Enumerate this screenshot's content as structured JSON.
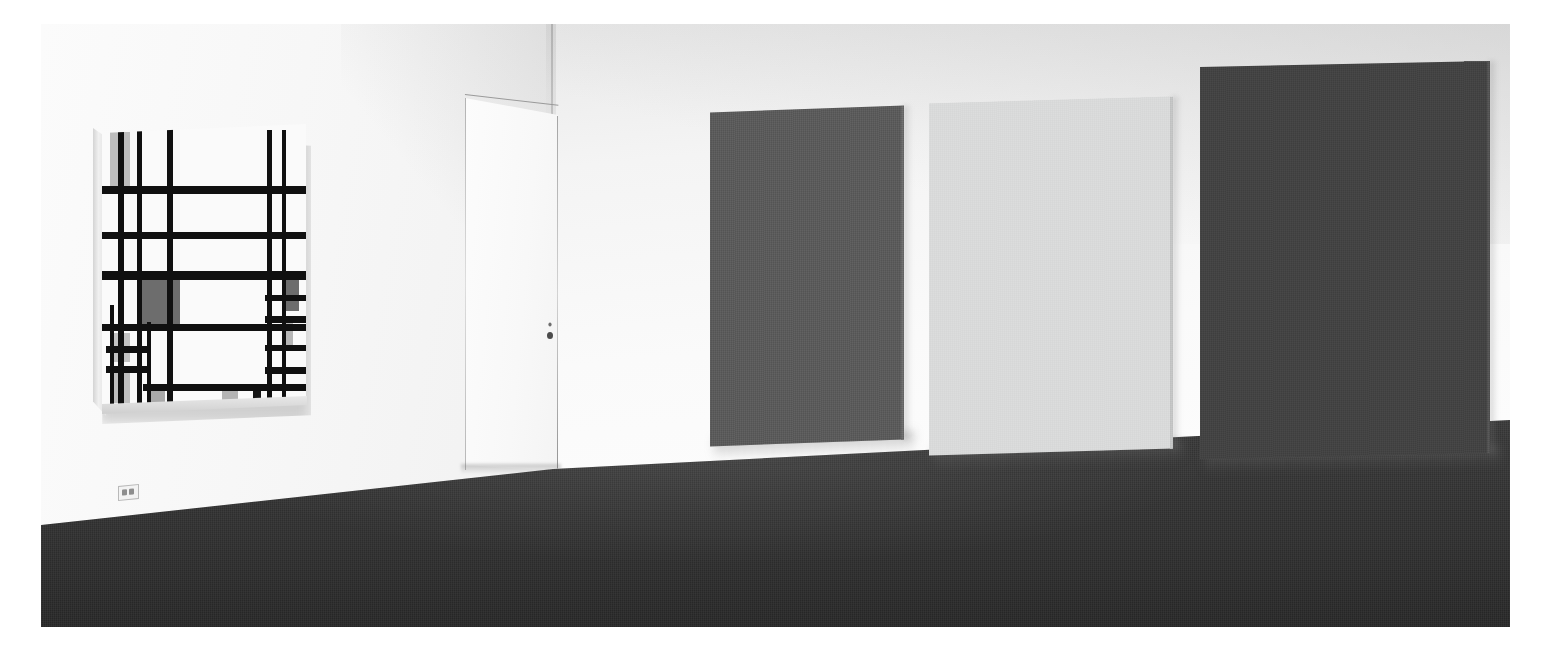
{
  "scene": {
    "title": "Gallery interior installation view",
    "room": {
      "wall_left_color": "#f7f7f7",
      "wall_right_color": "#f7f7f7",
      "floor_color": "#323232",
      "baseboard_color": "#fdfdfd",
      "corner_seam_label": "wall corner"
    },
    "door": {
      "label": "flush gallery door",
      "color": "#f9f9f9",
      "hardware": "keyhole-lock"
    },
    "outlet": {
      "label": "wall electrical outlet",
      "color": "#f3f3f3"
    }
  },
  "artworks": [
    {
      "id": "mondrian-grid",
      "wall": "left",
      "type": "neoplastic-grid-painting",
      "line_color": "#101010",
      "ground_color": "#fafafa",
      "accent_colors": [
        "#9a9a9a",
        "#c8c8c8",
        "#6b6b6b",
        "#bdbdbd"
      ],
      "description": "Black grid composition with gray and charcoal blocks on white ground"
    },
    {
      "id": "monochrome-left",
      "wall": "right",
      "type": "monochrome-panel",
      "color": "#5b5b5b",
      "description": "Medium-dark gray monochrome canvas"
    },
    {
      "id": "monochrome-center",
      "wall": "right",
      "type": "monochrome-panel",
      "color": "#d9dada",
      "description": "Pale light-gray monochrome canvas"
    },
    {
      "id": "monochrome-right",
      "wall": "right",
      "type": "monochrome-panel",
      "color": "#434343",
      "description": "Dark charcoal monochrome canvas"
    }
  ],
  "chart_data": {
    "type": "table",
    "columns": [
      "element",
      "kind",
      "x",
      "y",
      "w",
      "h",
      "color"
    ],
    "rows": [
      [
        "field-topleft-gray",
        "field",
        4.0,
        3.0,
        9.5,
        21.0,
        "#bdbdbd"
      ],
      [
        "field-mid-charcoal",
        "field",
        19.0,
        54.0,
        19.0,
        19.0,
        "#6d6d6d"
      ],
      [
        "field-left-gray-a",
        "field",
        4.0,
        74.0,
        9.5,
        10.0,
        "#c3c3c3"
      ],
      [
        "field-left-gray-b",
        "field",
        4.0,
        86.5,
        9.5,
        12.0,
        "#bfbfbf"
      ],
      [
        "field-right-charcoal",
        "field",
        88.5,
        53.0,
        8.0,
        13.0,
        "#6d6d6d"
      ],
      [
        "field-right-gray",
        "field",
        88.5,
        70.0,
        5.0,
        8.0,
        "#b6b6b6"
      ],
      [
        "field-bottom-gray-a",
        "field",
        24.0,
        93.0,
        7.0,
        6.0,
        "#a9a9a9"
      ],
      [
        "field-bottom-gray-b",
        "field",
        59.0,
        93.0,
        7.5,
        6.0,
        "#b4b4b4"
      ],
      [
        "field-bottom-black",
        "field",
        74.0,
        93.0,
        4.0,
        6.0,
        "#151515"
      ],
      [
        "vline-1",
        "bar-v",
        8.0,
        0.0,
        2.6,
        100.0,
        "#101010"
      ],
      [
        "vline-2",
        "bar-v",
        17.0,
        0.0,
        2.6,
        100.0,
        "#101010"
      ],
      [
        "vline-3",
        "bar-v",
        32.0,
        0.0,
        2.6,
        100.0,
        "#101010"
      ],
      [
        "vline-4",
        "bar-v",
        81.0,
        2.0,
        2.2,
        98.0,
        "#101010"
      ],
      [
        "vline-5",
        "bar-v",
        88.0,
        2.0,
        2.2,
        98.0,
        "#101010"
      ],
      [
        "vline-6",
        "bar-v",
        4.0,
        64.0,
        2.0,
        36.0,
        "#101010"
      ],
      [
        "vline-7",
        "bar-v",
        22.0,
        70.0,
        2.2,
        30.0,
        "#101010"
      ],
      [
        "hline-1",
        "bar-h",
        0.0,
        22.0,
        100.0,
        2.8,
        "#101010"
      ],
      [
        "hline-2",
        "bar-h",
        0.0,
        38.0,
        100.0,
        2.6,
        "#101010"
      ],
      [
        "hline-3",
        "bar-h",
        0.0,
        52.0,
        100.0,
        3.0,
        "#101010"
      ],
      [
        "hline-4",
        "bar-h",
        0.0,
        70.5,
        100.0,
        2.8,
        "#101010"
      ],
      [
        "hline-5",
        "bar-h",
        2.0,
        78.5,
        22.0,
        2.4,
        "#101010"
      ],
      [
        "hline-6",
        "bar-h",
        2.0,
        85.5,
        22.0,
        2.4,
        "#101010"
      ],
      [
        "hline-7",
        "bar-h",
        20.0,
        92.0,
        80.0,
        2.4,
        "#101010"
      ],
      [
        "hline-8",
        "bar-h",
        80.0,
        60.5,
        20.0,
        2.2,
        "#101010"
      ],
      [
        "hline-9",
        "bar-h",
        80.0,
        68.0,
        20.0,
        2.2,
        "#101010"
      ],
      [
        "hline-10",
        "bar-h",
        80.0,
        78.0,
        20.0,
        2.2,
        "#101010"
      ],
      [
        "hline-11",
        "bar-h",
        80.0,
        86.0,
        20.0,
        2.2,
        "#101010"
      ]
    ]
  },
  "panel_layout": [
    {
      "name": "monochrome-left",
      "left": 669,
      "top": 85,
      "width": 194,
      "height": 334,
      "color": "#5b5b5b",
      "skew": -2.0,
      "edge": "#6a6a6a"
    },
    {
      "name": "monochrome-center",
      "left": 888,
      "top": 76,
      "width": 244,
      "height": 352,
      "color": "#d9dada",
      "skew": -1.6,
      "edge": "#c4c5c5"
    },
    {
      "name": "monochrome-right",
      "left": 1159,
      "top": 40,
      "width": 290,
      "height": 392,
      "color": "#434343",
      "skew": -1.2,
      "edge": "#535353"
    }
  ]
}
